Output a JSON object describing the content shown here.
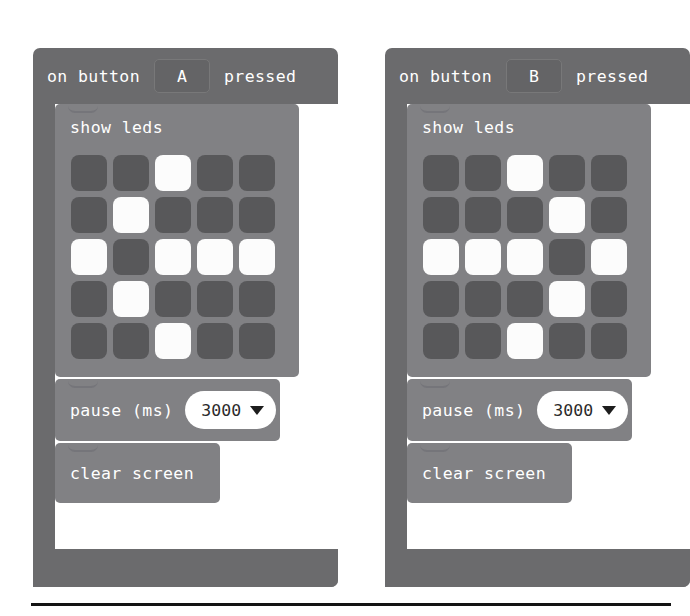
{
  "editor": {
    "name": "microbit-blocks-editor",
    "colors": {
      "event_block": "#6b6b6d",
      "statement_block": "#818184",
      "led_off": "#58585a",
      "led_on": "#fcfcfc",
      "field_text": "#2a2a2a",
      "block_text": "#ffffff",
      "rule": "#131313"
    }
  },
  "blocks": [
    {
      "id": "on-button-a-pressed",
      "header": {
        "prefix": "on button",
        "selected_button": "A",
        "suffix": "pressed",
        "options": [
          "A",
          "B",
          "A+B"
        ]
      },
      "body": [
        {
          "type": "show-leds",
          "label": "show leds",
          "grid": [
            [
              0,
              0,
              1,
              0,
              0
            ],
            [
              0,
              1,
              0,
              0,
              0
            ],
            [
              1,
              0,
              1,
              1,
              1
            ],
            [
              0,
              1,
              0,
              0,
              0
            ],
            [
              0,
              0,
              1,
              0,
              0
            ]
          ]
        },
        {
          "type": "pause",
          "label": "pause (ms)",
          "value": "3000",
          "options": [
            "100",
            "200",
            "500",
            "1000",
            "2000",
            "3000",
            "5000"
          ]
        },
        {
          "type": "clear-screen",
          "label": "clear screen"
        }
      ]
    },
    {
      "id": "on-button-b-pressed",
      "header": {
        "prefix": "on button",
        "selected_button": "B",
        "suffix": "pressed",
        "options": [
          "A",
          "B",
          "A+B"
        ]
      },
      "body": [
        {
          "type": "show-leds",
          "label": "show leds",
          "grid": [
            [
              0,
              0,
              1,
              0,
              0
            ],
            [
              0,
              0,
              0,
              1,
              0
            ],
            [
              1,
              1,
              1,
              0,
              1
            ],
            [
              0,
              0,
              0,
              1,
              0
            ],
            [
              0,
              0,
              1,
              0,
              0
            ]
          ]
        },
        {
          "type": "pause",
          "label": "pause (ms)",
          "value": "3000",
          "options": [
            "100",
            "200",
            "500",
            "1000",
            "2000",
            "3000",
            "5000"
          ]
        },
        {
          "type": "clear-screen",
          "label": "clear screen"
        }
      ]
    }
  ]
}
